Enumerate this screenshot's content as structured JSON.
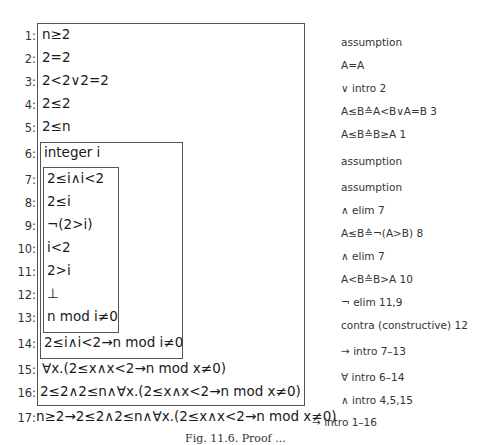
{
  "proof": {
    "lines": [
      {
        "num": "1:",
        "formula": "n≥2",
        "justification": "assumption"
      },
      {
        "num": "2:",
        "formula": "2=2",
        "justification": "A=A"
      },
      {
        "num": "3:",
        "formula": "2<2∨2=2",
        "justification": "∨ intro 2"
      },
      {
        "num": "4:",
        "formula": "2≤2",
        "justification": "A≤B≙A<B∨A=B 3"
      },
      {
        "num": "5:",
        "formula": "2≤n",
        "justification": "A≤B≙B≥A 1"
      },
      {
        "num": "6:",
        "formula": "integer i",
        "justification": "assumption"
      },
      {
        "num": "7:",
        "formula": "2≤i∧i<2",
        "justification": "assumption"
      },
      {
        "num": "8:",
        "formula": "2≤i",
        "justification": "∧ elim 7"
      },
      {
        "num": "9:",
        "formula": "¬(2>i)",
        "justification": "A≤B≙¬(A>B) 8"
      },
      {
        "num": "10:",
        "formula": "i<2",
        "justification": "∧ elim 7"
      },
      {
        "num": "11:",
        "formula": "2>i",
        "justification": "A<B≙B>A 10"
      },
      {
        "num": "12:",
        "formula": "⊥",
        "justification": "¬ elim 11,9"
      },
      {
        "num": "13:",
        "formula": "n mod i≠0",
        "justification": "contra (constructive) 12"
      },
      {
        "num": "14:",
        "formula": "2≤i∧i<2→n mod i≠0",
        "justification": "→ intro 7–13"
      },
      {
        "num": "15:",
        "formula": "∀x.(2≤x∧x<2→n mod x≠0)",
        "justification": "∀ intro 6–14"
      },
      {
        "num": "16:",
        "formula": "2≤2∧2≤n∧∀x.(2≤x∧x<2→n mod x≠0)",
        "justification": "∧ intro 4,5,15"
      },
      {
        "num": "17:",
        "formula": "n≥2→2≤2∧2≤n∧∀x.(2≤x∧x<2→n mod x≠0)",
        "justification": "→ intro 1–16"
      }
    ]
  },
  "caption": "Fig. 11.6. Proof ..."
}
